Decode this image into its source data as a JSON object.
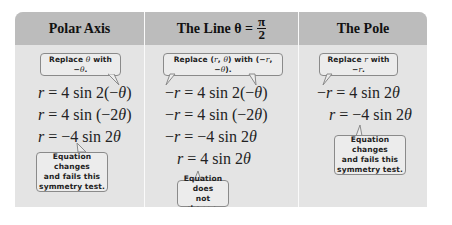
{
  "table": {
    "columns": [
      {
        "header": "Polar Axis",
        "callout_top": "Replace θ with −θ.",
        "equations": [
          "r = 4 sin 2(−θ)",
          "r = 4 sin (−2θ)",
          "r = −4 sin 2θ"
        ],
        "callout_bottom": [
          "Equation changes",
          "and fails this",
          "symmetry test."
        ]
      },
      {
        "header": "The Line θ =",
        "header_fraction": {
          "numerator": "π",
          "denominator": "2"
        },
        "callout_top": "Replace (r, θ) with (−r, −θ).",
        "equations": [
          "−r = 4 sin 2(−θ)",
          "−r = 4 sin (−2θ)",
          "−r = −4 sin 2θ",
          "r = 4 sin 2θ"
        ],
        "callout_bottom": [
          "Equation does",
          "not change."
        ]
      },
      {
        "header": "The Pole",
        "callout_top": "Replace r with −r.",
        "equations": [
          "−r = 4 sin 2θ",
          "r = −4 sin 2θ"
        ],
        "callout_bottom": [
          "Equation changes",
          "and fails this",
          "symmetry test."
        ]
      }
    ]
  },
  "colors": {
    "header_bg": "#bcbcbc",
    "body_bg": "#e4e4e4",
    "callout_border": "#8a8a8a",
    "page_bg": "#ffffff"
  }
}
